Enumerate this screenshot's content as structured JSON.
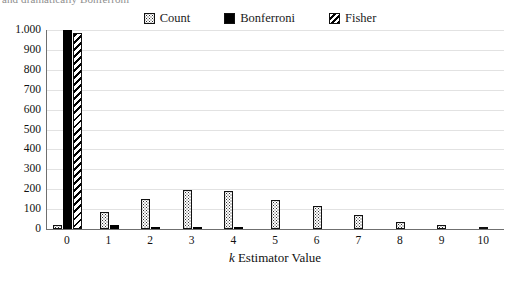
{
  "caption": {
    "text": "and dramatically Bonferroni"
  },
  "legend": {
    "position": "top-center",
    "items": [
      {
        "label": "Count",
        "pattern": "dotted",
        "swatch_class": "sw-count"
      },
      {
        "label": "Bonferroni",
        "pattern": "solid-black",
        "swatch_class": "sw-bonferroni"
      },
      {
        "label": "Fisher",
        "pattern": "diagonal-hatch",
        "swatch_class": "sw-fisher"
      }
    ]
  },
  "axes": {
    "x_title_italic": "k",
    "x_title_rest": " Estimator Value",
    "y_ticks": [
      "0",
      "100",
      "200",
      "300",
      "400",
      "500",
      "600",
      "700",
      "800",
      "900",
      "1.000"
    ],
    "x_ticks": [
      "0",
      "1",
      "2",
      "3",
      "4",
      "5",
      "6",
      "7",
      "8",
      "9",
      "10"
    ]
  },
  "chart_data": {
    "type": "bar",
    "title": "",
    "xlabel": "k Estimator Value",
    "ylabel": "",
    "ylim": [
      0,
      1000
    ],
    "ytick_step": 100,
    "grid": true,
    "legend_position": "top-center",
    "categories": [
      "0",
      "1",
      "2",
      "3",
      "4",
      "5",
      "6",
      "7",
      "8",
      "9",
      "10"
    ],
    "series": [
      {
        "name": "Count",
        "pattern": "dotted",
        "values": [
          20,
          88,
          150,
          196,
          193,
          148,
          115,
          70,
          36,
          22,
          9
        ]
      },
      {
        "name": "Bonferroni",
        "pattern": "solid-black",
        "values": [
          1000,
          18,
          8,
          7,
          7,
          0,
          0,
          0,
          0,
          0,
          0
        ]
      },
      {
        "name": "Fisher",
        "pattern": "diagonal-hatch",
        "values": [
          985,
          0,
          0,
          0,
          0,
          0,
          0,
          0,
          0,
          0,
          0
        ]
      }
    ]
  }
}
